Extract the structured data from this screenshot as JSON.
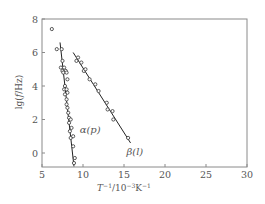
{
  "chart_data": {
    "type": "scatter",
    "title": "",
    "xlabel": "T^-1/10^-3K^-1",
    "ylabel": "lg(f/Hz)",
    "xlim": [
      5,
      30
    ],
    "ylim": [
      -0.85,
      8
    ],
    "xticks": [
      5,
      10,
      15,
      20,
      25,
      30
    ],
    "yticks": [
      0,
      2,
      4,
      6,
      8
    ],
    "grid": false,
    "legend": "none (inline labels)",
    "series": [
      {
        "name": "α(p)",
        "label_position": [
          9.6,
          1.2
        ],
        "marker": "open-circle",
        "points": [
          [
            6.2,
            7.4
          ],
          [
            6.8,
            6.2
          ],
          [
            7.4,
            6.2
          ],
          [
            7.5,
            5.5
          ],
          [
            7.3,
            5.1
          ],
          [
            7.7,
            5.1
          ],
          [
            7.5,
            4.9
          ],
          [
            7.9,
            4.9
          ],
          [
            7.6,
            4.8
          ],
          [
            8.0,
            4.8
          ],
          [
            8.1,
            4.4
          ],
          [
            7.8,
            4.0
          ],
          [
            7.7,
            3.8
          ],
          [
            8.0,
            3.8
          ],
          [
            8.1,
            3.6
          ],
          [
            7.8,
            3.5
          ],
          [
            8.0,
            3.2
          ],
          [
            8.0,
            2.9
          ],
          [
            8.1,
            2.7
          ],
          [
            8.2,
            2.4
          ],
          [
            8.3,
            2.1
          ],
          [
            8.5,
            2.0
          ],
          [
            8.3,
            1.8
          ],
          [
            8.6,
            1.5
          ],
          [
            8.4,
            1.3
          ],
          [
            8.5,
            0.9
          ],
          [
            8.8,
            1.0
          ],
          [
            8.8,
            0.4
          ],
          [
            9.0,
            -0.3
          ],
          [
            8.9,
            -0.6
          ]
        ],
        "fit_line": [
          [
            7.2,
            6.6
          ],
          [
            8.9,
            -0.8
          ]
        ]
      },
      {
        "name": "β(l)",
        "label_position": [
          15.3,
          -0.1
        ],
        "marker": "open-circle",
        "points": [
          [
            9.2,
            5.5
          ],
          [
            9.4,
            5.7
          ],
          [
            9.8,
            5.4
          ],
          [
            10.1,
            4.9
          ],
          [
            10.3,
            5.0
          ],
          [
            10.8,
            4.4
          ],
          [
            11.5,
            4.1
          ],
          [
            11.9,
            3.7
          ],
          [
            12.9,
            3.0
          ],
          [
            13.0,
            2.6
          ],
          [
            13.6,
            2.5
          ],
          [
            13.7,
            2.0
          ],
          [
            15.5,
            0.9
          ]
        ],
        "fit_line": [
          [
            8.8,
            6.0
          ],
          [
            15.8,
            0.6
          ]
        ]
      }
    ]
  },
  "labels": {
    "alpha": "α(p)",
    "beta": "β(l)"
  },
  "colors": {
    "frame": "#8a8a8a",
    "marker": "#333333",
    "line": "#222222",
    "text": "#555555"
  }
}
